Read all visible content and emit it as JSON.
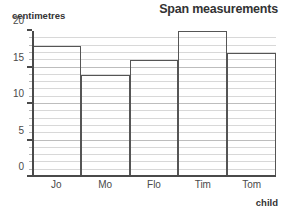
{
  "chart_data": {
    "type": "bar",
    "title": "Span measurements",
    "xlabel": "child",
    "ylabel": "centimetres",
    "categories": [
      "Jo",
      "Mo",
      "Flo",
      "Tim",
      "Tom"
    ],
    "values": [
      18,
      14,
      16,
      20,
      17
    ],
    "ylim": [
      0,
      20
    ],
    "ytick_labels": [
      "0",
      "5",
      "10",
      "15",
      "20"
    ],
    "ytick_values": [
      0,
      5,
      10,
      15,
      20
    ],
    "minor_tick_step": 1,
    "grid": "horizontal",
    "legend": "none",
    "bar_style": "outlined-adjacent",
    "colors": {
      "bar_outline": "#555555",
      "axis": "#4a4a4a",
      "gridline": "#d8d8d8",
      "gridline_major": "#bdbdbd",
      "text": "#3a3a3a",
      "background": "#ffffff"
    }
  }
}
